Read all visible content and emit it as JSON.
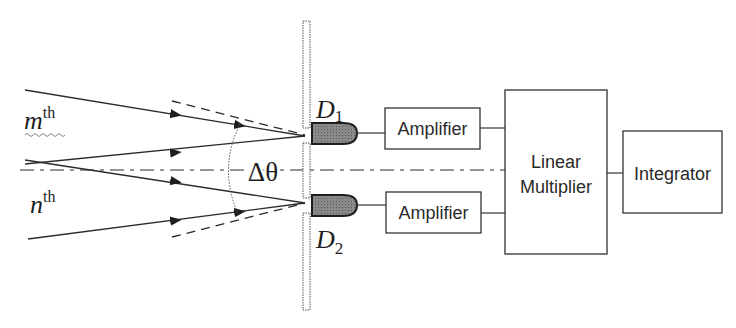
{
  "diagram": {
    "labels": {
      "m_order": {
        "base": "m",
        "sup": "th"
      },
      "n_order": {
        "base": "n",
        "sup": "th"
      },
      "angle": "Δθ",
      "detector1": {
        "base": "D",
        "sub": "1"
      },
      "detector2": {
        "base": "D",
        "sub": "2"
      }
    },
    "blocks": {
      "amplifier1": "Amplifier",
      "amplifier2": "Amplifier",
      "multiplier_line1": "Linear",
      "multiplier_line2": "Multiplier",
      "integrator": "Integrator"
    },
    "colors": {
      "line": "#2b2b2b",
      "detector_fill": "#7a7a7a",
      "background": "#ffffff"
    }
  }
}
